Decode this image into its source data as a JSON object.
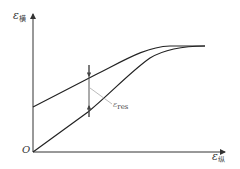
{
  "diagram": {
    "axes": {
      "y": {
        "symbol": "ε",
        "subscript": "横"
      },
      "x": {
        "symbol": "ε",
        "subscript": "纵"
      },
      "origin": "O"
    },
    "annotation": {
      "symbol": "ε",
      "subscript": "res"
    },
    "curves": [
      {
        "name": "upper-curve",
        "description": "starts on y-axis above origin, rises and flattens to plateau"
      },
      {
        "name": "lower-curve",
        "description": "starts at origin, rises and merges with upper curve at plateau"
      }
    ],
    "colors": {
      "line": "#222222",
      "axis": "#333333",
      "annotation_line": "#aaaaaa"
    }
  }
}
